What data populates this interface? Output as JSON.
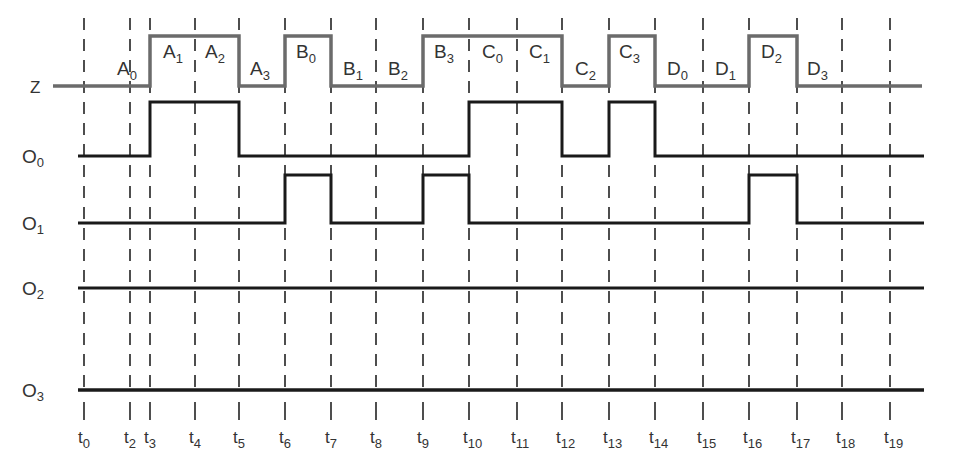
{
  "diagram": {
    "title": "",
    "signals": [
      {
        "id": "Z",
        "label": "Z",
        "sub": "",
        "color": "#6b6b6b",
        "width": 3.5,
        "low_y": 86,
        "high_y": 36
      },
      {
        "id": "O0",
        "label": "O",
        "sub": "0",
        "color": "#1a1a1a",
        "width": 3,
        "low_y": 156,
        "high_y": 102
      },
      {
        "id": "O1",
        "label": "O",
        "sub": "1",
        "color": "#1a1a1a",
        "width": 3,
        "low_y": 223,
        "high_y": 175
      },
      {
        "id": "O2",
        "label": "O",
        "sub": "2",
        "color": "#1a1a1a",
        "width": 3,
        "low_y": 288,
        "high_y": 288
      },
      {
        "id": "O3",
        "label": "O",
        "sub": "3",
        "color": "#1a1a1a",
        "width": 3.5,
        "low_y": 390,
        "high_y": 390
      }
    ],
    "time_markers": [
      {
        "label": "t",
        "sub": "0",
        "x": 84
      },
      {
        "label": "t",
        "sub": "2",
        "x": 130
      },
      {
        "label": "t",
        "sub": "3",
        "x": 150
      },
      {
        "label": "t",
        "sub": "4",
        "x": 195
      },
      {
        "label": "t",
        "sub": "5",
        "x": 239
      },
      {
        "label": "t",
        "sub": "6",
        "x": 285
      },
      {
        "label": "t",
        "sub": "7",
        "x": 331
      },
      {
        "label": "t",
        "sub": "8",
        "x": 376
      },
      {
        "label": "t",
        "sub": "9",
        "x": 423
      },
      {
        "label": "t",
        "sub": "10",
        "x": 469
      },
      {
        "label": "t",
        "sub": "11",
        "x": 517
      },
      {
        "label": "t",
        "sub": "12",
        "x": 562
      },
      {
        "label": "t",
        "sub": "13",
        "x": 609
      },
      {
        "label": "t",
        "sub": "14",
        "x": 655
      },
      {
        "label": "t",
        "sub": "15",
        "x": 703
      },
      {
        "label": "t",
        "sub": "16",
        "x": 749
      },
      {
        "label": "t",
        "sub": "17",
        "x": 797
      },
      {
        "label": "t",
        "sub": "18",
        "x": 842
      },
      {
        "label": "t",
        "sub": "19",
        "x": 890
      }
    ],
    "x_start": 53,
    "x_end": 922,
    "waveforms": {
      "Z": [
        [
          53,
          "L"
        ],
        [
          150,
          "H"
        ],
        [
          239,
          "L"
        ],
        [
          285,
          "H"
        ],
        [
          331,
          "L"
        ],
        [
          423,
          "H"
        ],
        [
          562,
          "L"
        ],
        [
          609,
          "H"
        ],
        [
          655,
          "L"
        ],
        [
          749,
          "H"
        ],
        [
          797,
          "L"
        ],
        [
          922,
          "L"
        ]
      ],
      "O0": [
        [
          78,
          "L"
        ],
        [
          150,
          "H"
        ],
        [
          239,
          "L"
        ],
        [
          469,
          "H"
        ],
        [
          562,
          "L"
        ],
        [
          609,
          "H"
        ],
        [
          655,
          "L"
        ],
        [
          924,
          "L"
        ]
      ],
      "O1": [
        [
          78,
          "L"
        ],
        [
          285,
          "H"
        ],
        [
          331,
          "L"
        ],
        [
          423,
          "H"
        ],
        [
          469,
          "L"
        ],
        [
          749,
          "H"
        ],
        [
          797,
          "L"
        ],
        [
          924,
          "L"
        ]
      ],
      "O2": [
        [
          78,
          "L"
        ],
        [
          924,
          "L"
        ]
      ],
      "O3": [
        [
          78,
          "L"
        ],
        [
          924,
          "L"
        ]
      ]
    },
    "z_segment_labels": [
      {
        "letter": "A",
        "sub": "0",
        "x": 117,
        "level": "L"
      },
      {
        "letter": "A",
        "sub": "1",
        "x": 163,
        "level": "H"
      },
      {
        "letter": "A",
        "sub": "2",
        "x": 205,
        "level": "H"
      },
      {
        "letter": "A",
        "sub": "3",
        "x": 250,
        "level": "L"
      },
      {
        "letter": "B",
        "sub": "0",
        "x": 296,
        "level": "H"
      },
      {
        "letter": "B",
        "sub": "1",
        "x": 343,
        "level": "L"
      },
      {
        "letter": "B",
        "sub": "2",
        "x": 388,
        "level": "L"
      },
      {
        "letter": "B",
        "sub": "3",
        "x": 434,
        "level": "H"
      },
      {
        "letter": "C",
        "sub": "0",
        "x": 482,
        "level": "H"
      },
      {
        "letter": "C",
        "sub": "1",
        "x": 529,
        "level": "H"
      },
      {
        "letter": "C",
        "sub": "2",
        "x": 575,
        "level": "L"
      },
      {
        "letter": "C",
        "sub": "3",
        "x": 619,
        "level": "H"
      },
      {
        "letter": "D",
        "sub": "0",
        "x": 667,
        "level": "L"
      },
      {
        "letter": "D",
        "sub": "1",
        "x": 715,
        "level": "L"
      },
      {
        "letter": "D",
        "sub": "2",
        "x": 761,
        "level": "H"
      },
      {
        "letter": "D",
        "sub": "3",
        "x": 807,
        "level": "L"
      }
    ],
    "gridline": {
      "y_top": 18,
      "y_bottom": 396,
      "dash": "12 9",
      "color": "#222222"
    },
    "ticks": {
      "y_top": 402,
      "y_bottom": 420
    },
    "time_label_y": 443
  }
}
